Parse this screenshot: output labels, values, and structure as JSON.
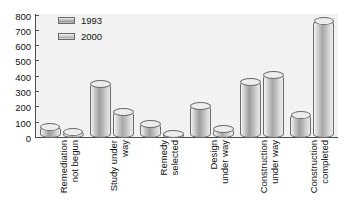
{
  "chart_data": {
    "type": "bar",
    "title": "",
    "subtitle": "",
    "xlabel": "",
    "ylabel": "",
    "ylim": [
      0,
      800
    ],
    "yticks": [
      800,
      700,
      600,
      500,
      400,
      300,
      200,
      100,
      0
    ],
    "grid": false,
    "legend_position": "top-left",
    "categories": [
      "Remediation not begun",
      "Study under way",
      "Remedy selected",
      "Design under way",
      "Construction under way",
      "Construction completed"
    ],
    "category_lines": [
      [
        "Remediation",
        "not begun"
      ],
      [
        "Study under",
        "way"
      ],
      [
        "Remedy",
        "selected"
      ],
      [
        "Design",
        "under way"
      ],
      [
        "Construction",
        "under way"
      ],
      [
        "Construction",
        "completed"
      ]
    ],
    "series": [
      {
        "name": "1993",
        "color": "#9e9e9e",
        "values": [
          75,
          355,
          95,
          210,
          370,
          155
        ]
      },
      {
        "name": "2000",
        "color": "#b4b4b4",
        "values": [
          45,
          175,
          35,
          65,
          410,
          760
        ]
      }
    ]
  },
  "axis": {
    "y_tick_0": "0",
    "y_tick_100": "100",
    "y_tick_200": "200",
    "y_tick_300": "300",
    "y_tick_400": "400",
    "y_tick_500": "500",
    "y_tick_600": "600",
    "y_tick_700": "700",
    "y_tick_800": "800"
  },
  "legend": {
    "entries": [
      {
        "label": "1993"
      },
      {
        "label": "2000"
      }
    ]
  }
}
